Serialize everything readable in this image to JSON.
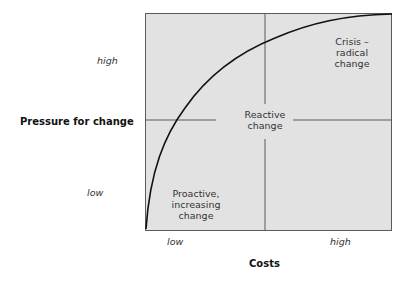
{
  "diagram": {
    "type": "quadrant-curve",
    "y_axis": {
      "label": "Pressure for change",
      "ticks": [
        "high",
        "low"
      ]
    },
    "x_axis": {
      "label": "Costs",
      "ticks": [
        "low",
        "high"
      ]
    },
    "regions": {
      "proactive": "Proactive, increasing change",
      "proactive_lines": [
        "Proactive,",
        "increasing",
        "change"
      ],
      "reactive_lines": [
        "Reactive",
        "change"
      ],
      "crisis_lines": [
        "Crisis –",
        "radical",
        "change"
      ]
    },
    "curve": "concave increasing curve from low-cost/low-pressure to high-cost/high-pressure",
    "colors": {
      "background": "#e2e2e2",
      "lines": "#5a5a5a",
      "curve": "#111111"
    }
  }
}
